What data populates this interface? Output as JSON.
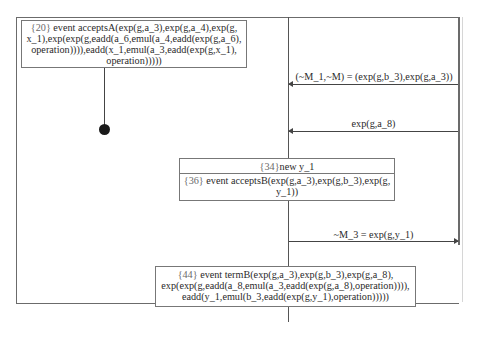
{
  "diagram": {
    "type": "message-sequence-chart",
    "box_a": {
      "label": "{20}",
      "text": "event acceptsA(exp(g,a_3),exp(g,a_4),exp(g,",
      "lines": [
        "x_1),exp(exp(g,eadd(a_6,emul(a_4,eadd(exp(g,a_6),",
        "operation)))),eadd(x_1,emul(a_3,eadd(exp(g,x_1),",
        "operation)))))"
      ]
    },
    "messages": [
      {
        "label": "(~M_1,~M) = (exp(g,b_3),exp(g,a_3))",
        "direction": "left"
      },
      {
        "label": "exp(g,a_8)",
        "direction": "left"
      },
      {
        "label": "~M_3 = exp(g,y_1)",
        "direction": "right"
      }
    ],
    "box_b": {
      "row1_label": "{34}",
      "row1_text": "new y_1",
      "row2_label": "{36}",
      "row2_text": "event acceptsB(exp(g,a_3),exp(g,b_3),exp(g,",
      "row2_line2": "y_1))"
    },
    "box_c": {
      "label": "{44}",
      "text": "event termB(exp(g,a_3),exp(g,b_3),exp(g,a_8),",
      "lines": [
        "exp(exp(g,eadd(a_8,emul(a_3,eadd(exp(g,a_8),operation)))),",
        "eadd(y_1,emul(b_3,eadd(exp(g,y_1),operation)))))"
      ]
    },
    "colors": {
      "line": "#444444",
      "border": "#777777",
      "label": "#6a6a6a",
      "text": "#2a2a2a"
    }
  }
}
